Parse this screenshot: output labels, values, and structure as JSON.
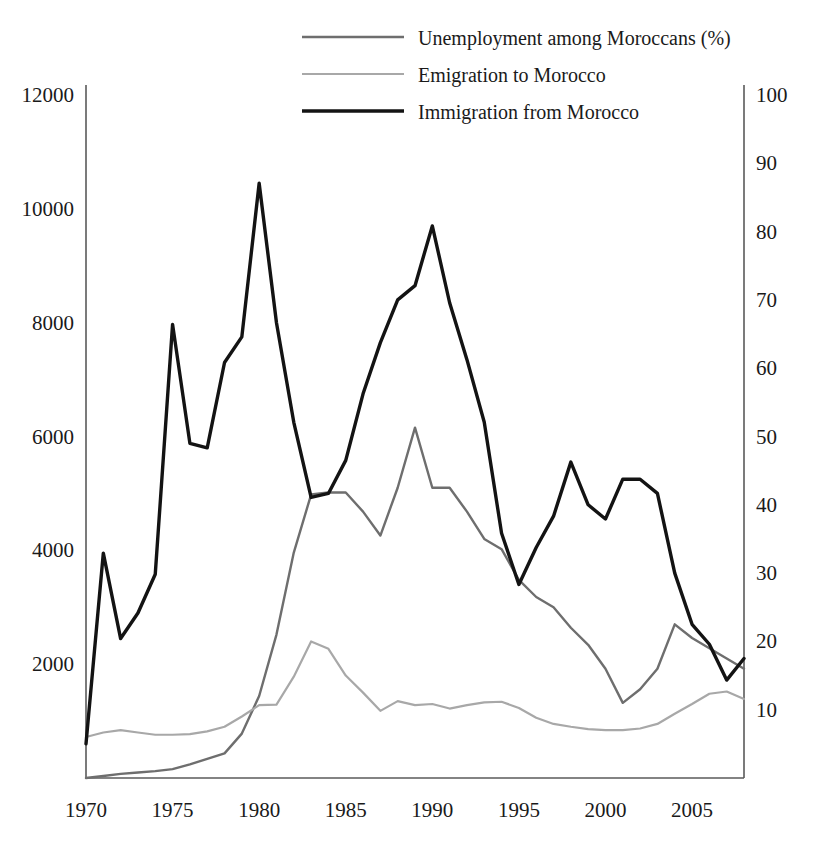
{
  "chart_data": {
    "type": "line",
    "title": "",
    "subtitle": "",
    "xlabel": "",
    "ylabel": "",
    "y2label": "",
    "grid": false,
    "legend_position": "top-center",
    "xlim": [
      1970,
      2008
    ],
    "ylim": [
      0,
      12000
    ],
    "y2lim": [
      0,
      100
    ],
    "x_ticks": [
      1970,
      1975,
      1980,
      1985,
      1990,
      1995,
      2000,
      2005
    ],
    "x_tick_labels": [
      "1970",
      "1975",
      "1980",
      "1985",
      "1990",
      "1995",
      "2000",
      "2005"
    ],
    "y_ticks": [
      2000,
      4000,
      6000,
      8000,
      10000,
      12000
    ],
    "y_tick_labels": [
      "2000",
      "4000",
      "6000",
      "8000",
      "10000",
      "12000"
    ],
    "y2_ticks": [
      10,
      20,
      30,
      40,
      50,
      60,
      70,
      80,
      90,
      100
    ],
    "y2_tick_labels": [
      "10",
      "20",
      "30",
      "40",
      "50",
      "60",
      "70",
      "80",
      "90",
      "100"
    ],
    "x": [
      1970,
      1971,
      1972,
      1973,
      1974,
      1975,
      1976,
      1977,
      1978,
      1979,
      1980,
      1981,
      1982,
      1983,
      1984,
      1985,
      1986,
      1987,
      1988,
      1989,
      1990,
      1991,
      1992,
      1993,
      1994,
      1995,
      1996,
      1997,
      1998,
      1999,
      2000,
      2001,
      2002,
      2003,
      2004,
      2005,
      2006,
      2007,
      2008
    ],
    "series": [
      {
        "name": "Unemployment among Moroccans (%)",
        "axis": "right",
        "color": "#6e6e6e",
        "width": 2.4,
        "values": [
          0,
          0.3,
          0.6,
          0.8,
          1.0,
          1.3,
          2.0,
          2.8,
          3.6,
          6.5,
          12.0,
          21.0,
          33.0,
          41.5,
          41.8,
          41.8,
          39.0,
          35.5,
          42.5,
          51.3,
          42.5,
          42.5,
          39.0,
          35.0,
          33.5,
          29.0,
          26.5,
          25.0,
          22.0,
          19.5,
          16.0,
          11.0,
          13.0,
          16.0,
          22.5,
          20.5,
          19.0,
          17.5,
          16.0
        ]
      },
      {
        "name": "Emigration to Morocco",
        "axis": "left",
        "color": "#a8a8a8",
        "width": 2.2,
        "values": [
          720,
          800,
          840,
          800,
          760,
          760,
          770,
          820,
          900,
          1080,
          1280,
          1290,
          1780,
          2400,
          2270,
          1800,
          1500,
          1180,
          1350,
          1280,
          1300,
          1220,
          1280,
          1330,
          1340,
          1230,
          1060,
          950,
          900,
          860,
          840,
          840,
          870,
          950,
          1130,
          1300,
          1480,
          1520,
          1390
        ]
      },
      {
        "name": "Immigration from Morocco",
        "axis": "left",
        "color": "#131313",
        "width": 3.4,
        "values": [
          600,
          3950,
          2450,
          2900,
          3580,
          7970,
          5880,
          5800,
          7300,
          7750,
          10450,
          8000,
          6250,
          4930,
          5000,
          5580,
          6750,
          7650,
          8400,
          8650,
          9700,
          8350,
          7350,
          6250,
          4300,
          3400,
          4050,
          4600,
          5550,
          4800,
          4550,
          5250,
          5250,
          5000,
          3600,
          2700,
          2350,
          1720,
          2100
        ]
      }
    ]
  },
  "legend": {
    "items": [
      {
        "label": "Unemployment among Moroccans (%)",
        "color": "#6e6e6e",
        "width": 2.6
      },
      {
        "label": "Emigration to Morocco",
        "color": "#a8a8a8",
        "width": 2.2
      },
      {
        "label": "Immigration from Morocco",
        "color": "#131313",
        "width": 3.6
      }
    ]
  },
  "axes": {
    "left_label": "",
    "right_label": "",
    "bottom_label": ""
  }
}
